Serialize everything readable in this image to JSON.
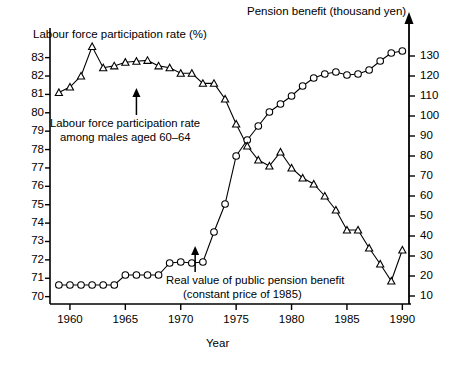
{
  "titles": {
    "left_axis_title": "Labour force participation rate (%)",
    "right_axis_title": "Pension benefit (thousand yen)",
    "x_axis_title": "Year"
  },
  "annotations": {
    "lfpr_line1": "Labour force participation rate",
    "lfpr_line2": "among males aged 60–64",
    "pension_line1": "Real value of public pension benefit",
    "pension_line2": "(constant price of 1985)"
  },
  "axes": {
    "left_ticks": [
      "83",
      "82",
      "81",
      "80",
      "79",
      "78",
      "77",
      "76",
      "75",
      "74",
      "73",
      "72",
      "71",
      "70"
    ],
    "right_ticks": [
      "130",
      "120",
      "110",
      "100",
      "90",
      "80",
      "70",
      "60",
      "50",
      "40",
      "30",
      "20",
      "10"
    ],
    "x_ticks": [
      "1960",
      "1965",
      "1970",
      "1975",
      "1980",
      "1985",
      "1990"
    ]
  },
  "colors": {
    "axis": "#000000",
    "series_line": "#000000",
    "marker_fill": "#ffffff",
    "background": "#ffffff"
  },
  "chart_data": {
    "type": "line",
    "title": "",
    "xlabel": "Year",
    "ylabel": "Labour force participation rate (%)",
    "y2label": "Pension benefit (thousand yen)",
    "xlim": [
      1958.2,
      1990.6
    ],
    "ylim": [
      69.6,
      83.85
    ],
    "y2lim": [
      6.0,
      137.0
    ],
    "grid": false,
    "legend": "none (inline annotations with arrows)",
    "x": [
      1959,
      1960,
      1961,
      1962,
      1963,
      1964,
      1965,
      1966,
      1967,
      1968,
      1969,
      1970,
      1971,
      1972,
      1973,
      1974,
      1975,
      1976,
      1977,
      1978,
      1979,
      1980,
      1981,
      1982,
      1983,
      1984,
      1985,
      1986,
      1987,
      1988,
      1989,
      1990
    ],
    "series": [
      {
        "name": "Labour force participation rate among males aged 60-64",
        "marker": "triangle",
        "axis": "left",
        "unit": "%",
        "values": [
          81.1,
          81.4,
          82.0,
          83.6,
          82.45,
          82.55,
          82.75,
          82.8,
          82.85,
          82.55,
          82.45,
          82.15,
          82.15,
          81.6,
          81.6,
          80.75,
          81.2,
          80.35,
          79.75,
          79.55,
          79.9,
          79.5,
          79.2,
          78.85,
          78.6,
          78.15,
          77.7,
          77.15,
          76.45,
          76.1,
          75.6,
          76.15
        ],
        "note": "Plotted against the left axis; right-axis equivalents are shown in pension_axis_values"
      },
      {
        "name": "Real value of public pension benefit (constant price of 1985)",
        "marker": "circle",
        "axis": "right",
        "unit": "thousand yen",
        "values": [
          15.5,
          15.5,
          15.5,
          15.5,
          15.5,
          15.5,
          20.5,
          20.5,
          20.5,
          20.5,
          26.5,
          27.0,
          26.5,
          27.0,
          42.0,
          56.0,
          80.0,
          88.0,
          95.0,
          102.0,
          106.0,
          110.0,
          115.0,
          119.0,
          121.0,
          122.0,
          120.5,
          121.0,
          123.0,
          127.5,
          131.5,
          132.5
        ]
      }
    ],
    "triangle_series_right_axis_reading": {
      "comment": "The triangle series' second half is read off the right-hand pension axis in the source figure.",
      "x": [
        1974,
        1975,
        1976,
        1977,
        1978,
        1979,
        1980,
        1981,
        1982,
        1983,
        1984,
        1985,
        1986,
        1987,
        1988,
        1989,
        1990
      ],
      "values": [
        100.0,
        96.0,
        85.0,
        78.0,
        75.0,
        82.0,
        74.0,
        69.0,
        66.0,
        60.0,
        53.0,
        43.0,
        43.0,
        34.0,
        26.0,
        17.5,
        33.0
      ]
    }
  }
}
